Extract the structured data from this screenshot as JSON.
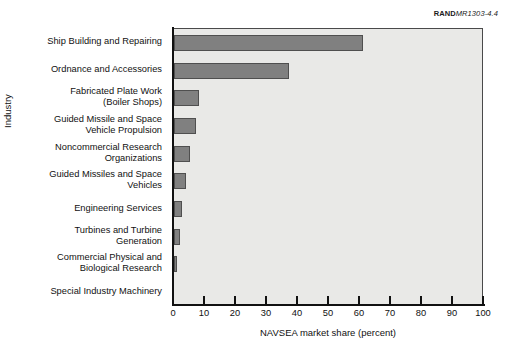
{
  "credit": {
    "brand": "RAND",
    "number": "MR1303-4.4"
  },
  "chart_data": {
    "type": "bar",
    "orientation": "horizontal",
    "title": "",
    "xlabel": "NAVSEA market share (percent)",
    "ylabel": "Industry",
    "xlim": [
      0,
      100
    ],
    "xticks": [
      0,
      10,
      20,
      30,
      40,
      50,
      60,
      70,
      80,
      90,
      100
    ],
    "grid": false,
    "legend": null,
    "bar_color": "#808080",
    "bar_edge_color": "#4f4f4f",
    "plot_background": "#e9e9e7",
    "categories": [
      "Ship Building and Repairing",
      "Ordnance and Accessories",
      "Fabricated Plate Work\n(Boiler Shops)",
      "Guided Missile and Space\nVehicle Propulsion",
      "Noncommercial Research\nOrganizations",
      "Guided Missiles and Space\nVehicles",
      "Engineering Services",
      "Turbines and Turbine\nGeneration",
      "Commercial Physical and\nBiological Research",
      "Special Industry Machinery"
    ],
    "values": [
      61,
      37,
      8,
      7,
      5,
      4,
      2.5,
      2,
      1,
      0
    ]
  }
}
